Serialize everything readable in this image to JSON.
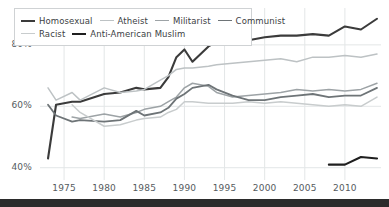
{
  "chart_data": {
    "type": "line",
    "title": "",
    "subtitle": "",
    "xlabel": "",
    "ylabel": "",
    "xlim": [
      1972,
      2014
    ],
    "ylim": [
      36,
      92
    ],
    "grid": true,
    "legend_position": "top-left",
    "y_ticks": [
      40,
      60,
      80
    ],
    "y_ticklabels": [
      "40%",
      "60%",
      "80%"
    ],
    "x_ticks": [
      1975,
      1980,
      1985,
      1990,
      1995,
      2000,
      2005,
      2010
    ],
    "x_ticklabels": [
      "1975",
      "1980",
      "1985",
      "1990",
      "1995",
      "2000",
      "2005",
      "2010"
    ],
    "series": [
      {
        "name": "Homosexual",
        "color": "#3b3b3b",
        "width": 2.1,
        "x": [
          1973,
          1974,
          1976,
          1977,
          1980,
          1982,
          1984,
          1985,
          1987,
          1988,
          1989,
          1990,
          1991,
          1993,
          1994,
          1996,
          1998,
          2000,
          2002,
          2004,
          2006,
          2008,
          2010,
          2012,
          2014
        ],
        "y": [
          43.0,
          60.5,
          61.5,
          61.5,
          64.0,
          64.5,
          66.0,
          65.5,
          66.0,
          69.5,
          76.0,
          78.5,
          74.5,
          79.5,
          81.0,
          81.5,
          81.5,
          82.5,
          83.0,
          83.0,
          83.5,
          83.0,
          86.0,
          85.0,
          88.5
        ]
      },
      {
        "name": "Atheist",
        "color": "#bdc2c4",
        "width": 1.5,
        "x": [
          1973,
          1974,
          1976,
          1977,
          1980,
          1982,
          1984,
          1985,
          1987,
          1988,
          1989,
          1990,
          1991,
          1993,
          1994,
          1996,
          1998,
          2000,
          2002,
          2004,
          2006,
          2008,
          2010,
          2012,
          2014
        ],
        "y": [
          66.0,
          62.0,
          64.5,
          62.0,
          66.0,
          64.5,
          65.0,
          65.5,
          68.5,
          70.0,
          72.0,
          72.5,
          72.5,
          73.0,
          73.5,
          74.0,
          74.5,
          75.0,
          75.5,
          74.5,
          76.0,
          76.0,
          76.5,
          76.0,
          77.0
        ]
      },
      {
        "name": "Militarist",
        "color": "#9da3a6",
        "width": 1.5,
        "x": [
          1976,
          1977,
          1980,
          1982,
          1984,
          1985,
          1987,
          1988,
          1989,
          1990,
          1991,
          1993,
          1994,
          1996,
          1998,
          2000,
          2002,
          2004,
          2006,
          2008,
          2010,
          2012,
          2014
        ],
        "y": [
          56.5,
          56.0,
          57.5,
          56.5,
          58.0,
          59.0,
          60.0,
          61.5,
          63.0,
          66.0,
          67.5,
          66.5,
          64.5,
          63.0,
          63.5,
          64.0,
          64.5,
          65.5,
          65.0,
          65.5,
          65.0,
          65.5,
          67.5
        ]
      },
      {
        "name": "Communist",
        "color": "#6e7477",
        "width": 1.8,
        "x": [
          1973,
          1974,
          1976,
          1977,
          1980,
          1982,
          1984,
          1985,
          1987,
          1988,
          1989,
          1990,
          1991,
          1993,
          1994,
          1996,
          1998,
          2000,
          2002,
          2004,
          2006,
          2008,
          2010,
          2012,
          2014
        ],
        "y": [
          60.5,
          57.0,
          55.0,
          55.5,
          55.0,
          55.5,
          58.5,
          57.0,
          58.0,
          59.5,
          62.5,
          64.0,
          66.0,
          67.0,
          65.5,
          63.5,
          62.0,
          62.0,
          63.0,
          63.5,
          64.0,
          63.0,
          63.5,
          63.5,
          66.0
        ]
      },
      {
        "name": "Racist",
        "color": "#c8cccd",
        "width": 1.5,
        "x": [
          1976,
          1977,
          1980,
          1982,
          1984,
          1985,
          1987,
          1988,
          1989,
          1990,
          1991,
          1993,
          1994,
          1996,
          1998,
          2000,
          2002,
          2004,
          2006,
          2008,
          2010,
          2012,
          2014
        ],
        "y": [
          60.5,
          58.0,
          53.5,
          54.0,
          55.5,
          56.0,
          56.5,
          58.0,
          59.0,
          61.5,
          61.5,
          61.0,
          61.0,
          61.0,
          61.5,
          61.0,
          61.5,
          61.0,
          60.5,
          60.0,
          60.5,
          60.0,
          63.0
        ]
      },
      {
        "name": "Anti-American Muslim",
        "color": "#1f1f1f",
        "width": 2.1,
        "x": [
          2008,
          2010,
          2012,
          2014
        ],
        "y": [
          41.0,
          41.0,
          43.5,
          43.0
        ]
      }
    ]
  },
  "legend": {
    "rows": [
      [
        {
          "label": "Homosexual",
          "color": "#3b3b3b",
          "width": 2.1
        },
        {
          "label": "Atheist",
          "color": "#bdc2c4",
          "width": 1.5
        },
        {
          "label": "Militarist",
          "color": "#9da3a6",
          "width": 1.5
        },
        {
          "label": "Communist",
          "color": "#6e7477",
          "width": 1.8
        }
      ],
      [
        {
          "label": "Racist",
          "color": "#c8cccd",
          "width": 1.5
        },
        {
          "label": "Anti-American Muslim",
          "color": "#1f1f1f",
          "width": 2.1
        }
      ]
    ]
  },
  "colors": {
    "background": "#ffffff",
    "grid": "#e3e6e7",
    "axis_text": "#555b5e",
    "legend_border": "#cfd2d4",
    "bottom_band": "#2b2b2b"
  }
}
